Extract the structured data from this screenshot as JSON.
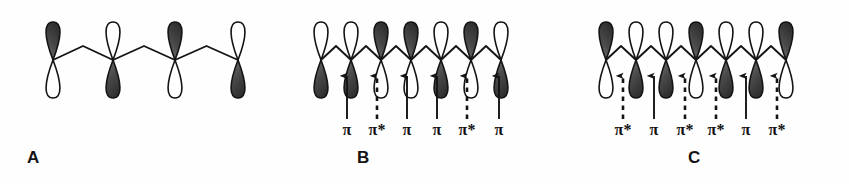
{
  "figure": {
    "background_color": "#fefefe",
    "ink_color": "#141414",
    "orbital_fill_dark": "#3a3a3a",
    "orbital_fill_light": "#ffffff",
    "panel_count": 3
  },
  "panels": [
    {
      "id": "A",
      "letter": "A",
      "orbital_count": 4,
      "orbitals": [
        {
          "index": 1,
          "x": 53,
          "shaded_lobe": "top"
        },
        {
          "index": 2,
          "x": 113,
          "shaded_lobe": "bottom"
        },
        {
          "index": 3,
          "x": 175,
          "shaded_lobe": "top"
        },
        {
          "index": 4,
          "x": 238,
          "shaded_lobe": "bottom"
        }
      ],
      "arrows": [],
      "labels": []
    },
    {
      "id": "B",
      "letter": "B",
      "orbital_count": 7,
      "orbitals": [
        {
          "index": 1,
          "x": 38,
          "shaded_lobe": "bottom"
        },
        {
          "index": 2,
          "x": 68,
          "shaded_lobe": "bottom"
        },
        {
          "index": 3,
          "x": 98,
          "shaded_lobe": "top"
        },
        {
          "index": 4,
          "x": 128,
          "shaded_lobe": "top"
        },
        {
          "index": 5,
          "x": 158,
          "shaded_lobe": "bottom"
        },
        {
          "index": 6,
          "x": 188,
          "shaded_lobe": "top"
        },
        {
          "index": 7,
          "x": 218,
          "shaded_lobe": "bottom"
        }
      ],
      "arrows": [
        {
          "index": 1,
          "x": 64,
          "style": "solid",
          "label": "π"
        },
        {
          "index": 2,
          "x": 94,
          "style": "dashed",
          "label": "π*"
        },
        {
          "index": 3,
          "x": 124,
          "style": "solid",
          "label": "π"
        },
        {
          "index": 4,
          "x": 154,
          "style": "solid",
          "label": "π"
        },
        {
          "index": 5,
          "x": 184,
          "style": "dashed",
          "label": "π*"
        },
        {
          "index": 6,
          "x": 216,
          "style": "solid",
          "label": "π"
        }
      ]
    },
    {
      "id": "C",
      "letter": "C",
      "orbital_count": 7,
      "orbitals": [
        {
          "index": 1,
          "x": 40,
          "shaded_lobe": "top"
        },
        {
          "index": 2,
          "x": 70,
          "shaded_lobe": "bottom"
        },
        {
          "index": 3,
          "x": 100,
          "shaded_lobe": "bottom"
        },
        {
          "index": 4,
          "x": 130,
          "shaded_lobe": "top"
        },
        {
          "index": 5,
          "x": 160,
          "shaded_lobe": "bottom"
        },
        {
          "index": 6,
          "x": 190,
          "shaded_lobe": "bottom"
        },
        {
          "index": 7,
          "x": 220,
          "shaded_lobe": "top"
        }
      ],
      "arrows": [
        {
          "index": 1,
          "x": 57,
          "style": "dashed",
          "label": "π*"
        },
        {
          "index": 2,
          "x": 88,
          "style": "solid",
          "label": "π"
        },
        {
          "index": 3,
          "x": 119,
          "style": "dashed",
          "label": "π*"
        },
        {
          "index": 4,
          "x": 150,
          "style": "dashed",
          "label": "π*"
        },
        {
          "index": 5,
          "x": 180,
          "style": "solid",
          "label": "π"
        },
        {
          "index": 6,
          "x": 211,
          "style": "dashed",
          "label": "π*"
        }
      ]
    }
  ]
}
